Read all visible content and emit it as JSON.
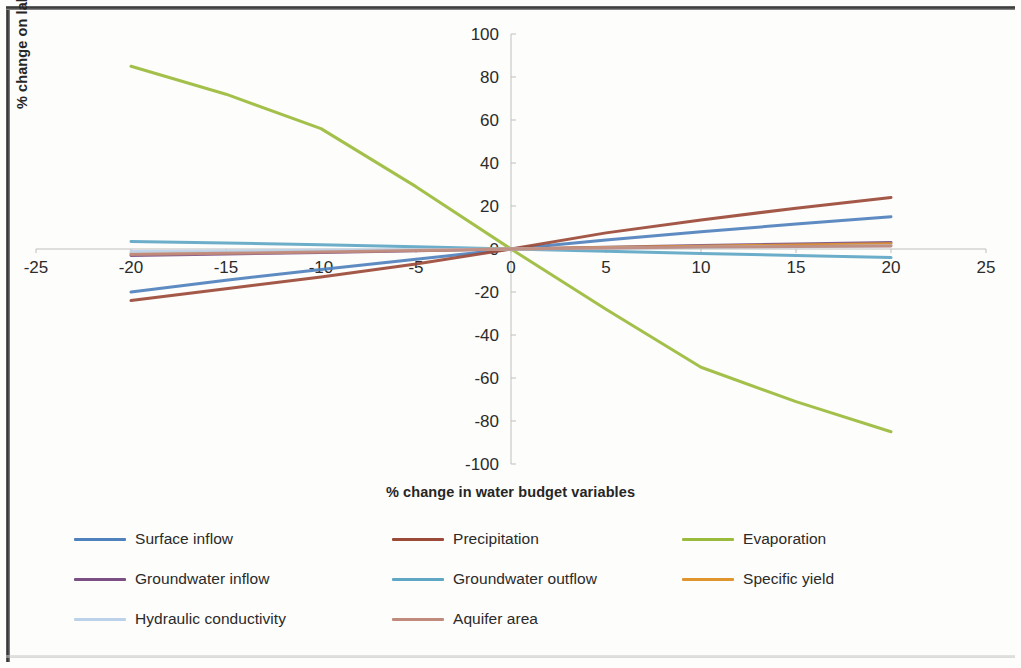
{
  "figure": {
    "background": "#fdfdfb",
    "frame_color": "#2e2e2e"
  },
  "axis": {
    "x_title": "% change in water budget variables",
    "y_title": "% change on lake level",
    "x_ticks": [
      "-25",
      "-20",
      "-15",
      "-10",
      "-5",
      "0",
      "5",
      "10",
      "15",
      "20",
      "25"
    ],
    "y_ticks": [
      "100",
      "80",
      "60",
      "40",
      "20",
      "0",
      "-20",
      "-40",
      "-60",
      "-80",
      "-100"
    ]
  },
  "legend": {
    "items": [
      {
        "label": "Surface inflow",
        "color": "#4f81bd"
      },
      {
        "label": "Precipitation",
        "color": "#9c4a38"
      },
      {
        "label": "Evaporation",
        "color": "#9bbb3c"
      },
      {
        "label": "Groundwater inflow",
        "color": "#7b4f84"
      },
      {
        "label": "Groundwater outflow",
        "color": "#5fa7c4"
      },
      {
        "label": "Specific yield",
        "color": "#e0952f"
      },
      {
        "label": "Hydraulic conductivity",
        "color": "#bcd2ea"
      },
      {
        "label": "Aquifer area",
        "color": "#c08a7d"
      }
    ]
  },
  "chart_data": {
    "type": "line",
    "title": "",
    "xlabel": "% change in water budget variables",
    "ylabel": "% change on lake level",
    "xlim": [
      -25,
      25
    ],
    "ylim": [
      -100,
      100
    ],
    "xtick_step": 5,
    "ytick_step": 20,
    "grid": false,
    "legend_position": "bottom",
    "x": [
      -20,
      -15,
      -10,
      -5,
      0,
      5,
      10,
      15,
      20
    ],
    "series": [
      {
        "name": "Surface inflow",
        "color": "#4f81bd",
        "values": [
          -20,
          -14.5,
          -9.5,
          -4.8,
          0,
          4.2,
          8.0,
          11.6,
          15.0
        ]
      },
      {
        "name": "Precipitation",
        "color": "#9c4a38",
        "values": [
          -24,
          -18.5,
          -13.0,
          -7.0,
          0,
          7.5,
          13.5,
          19.0,
          24.0
        ]
      },
      {
        "name": "Evaporation",
        "color": "#9bbb3c",
        "values": [
          85,
          72,
          56,
          29,
          0,
          -28,
          -55,
          -71,
          -85
        ]
      },
      {
        "name": "Groundwater inflow",
        "color": "#7b4f84",
        "values": [
          -3.0,
          -2.3,
          -1.6,
          -0.8,
          0,
          0.8,
          1.6,
          2.3,
          3.0
        ]
      },
      {
        "name": "Groundwater outflow",
        "color": "#5fa7c4",
        "values": [
          3.5,
          2.8,
          2.0,
          1.1,
          0,
          -1.1,
          -2.1,
          -3.0,
          -4.0
        ]
      },
      {
        "name": "Specific yield",
        "color": "#e0952f",
        "values": [
          -2.0,
          -1.6,
          -1.1,
          -0.6,
          0,
          0.7,
          1.3,
          1.9,
          2.4
        ]
      },
      {
        "name": "Hydraulic conductivity",
        "color": "#bcd2ea",
        "values": [
          -1.2,
          -0.9,
          -0.6,
          -0.3,
          0,
          0.4,
          0.8,
          1.1,
          1.5
        ]
      },
      {
        "name": "Aquifer area",
        "color": "#c08a7d",
        "values": [
          -2.6,
          -2.0,
          -1.4,
          -0.7,
          0,
          0.5,
          0.9,
          1.2,
          1.4
        ]
      }
    ]
  }
}
